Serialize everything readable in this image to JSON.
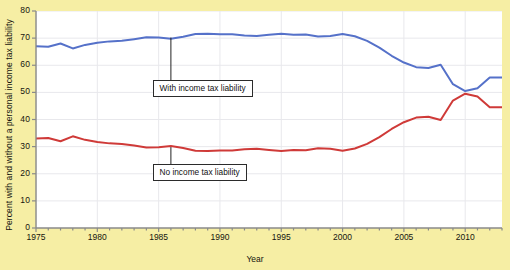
{
  "chart_data": {
    "type": "line",
    "title": "",
    "xlabel": "Year",
    "ylabel": "Percent with and without a personal income tax liability",
    "xlim": [
      1975,
      2013
    ],
    "ylim": [
      0,
      80
    ],
    "yticks": [
      0,
      10,
      20,
      30,
      40,
      50,
      60,
      70,
      80
    ],
    "xticks": [
      1975,
      1980,
      1985,
      1990,
      1995,
      2000,
      2005,
      2010
    ],
    "grid": true,
    "legend_position": "inline-callouts",
    "x": [
      1975,
      1976,
      1977,
      1978,
      1979,
      1980,
      1981,
      1982,
      1983,
      1984,
      1985,
      1986,
      1987,
      1988,
      1989,
      1990,
      1991,
      1992,
      1993,
      1994,
      1995,
      1996,
      1997,
      1998,
      1999,
      2000,
      2001,
      2002,
      2003,
      2004,
      2005,
      2006,
      2007,
      2008,
      2009,
      2010,
      2011,
      2012,
      2013
    ],
    "series": [
      {
        "name": "With income tax liability",
        "color": "#5571c9",
        "values": [
          67.0,
          66.8,
          68.0,
          66.2,
          67.5,
          68.3,
          68.8,
          69.0,
          69.6,
          70.3,
          70.2,
          69.8,
          70.5,
          71.5,
          71.6,
          71.4,
          71.4,
          71.0,
          70.8,
          71.2,
          71.6,
          71.2,
          71.3,
          70.6,
          70.8,
          71.5,
          70.7,
          69.0,
          66.5,
          63.5,
          61.0,
          59.3,
          59.0,
          60.2,
          53.0,
          50.5,
          51.5,
          55.5,
          55.5
        ]
      },
      {
        "name": "No income tax liability",
        "color": "#cf3a38",
        "values": [
          33.0,
          33.2,
          32.0,
          33.8,
          32.5,
          31.7,
          31.2,
          31.0,
          30.4,
          29.7,
          29.8,
          30.2,
          29.5,
          28.5,
          28.4,
          28.6,
          28.6,
          29.0,
          29.2,
          28.8,
          28.4,
          28.8,
          28.7,
          29.4,
          29.2,
          28.5,
          29.3,
          31.0,
          33.5,
          36.5,
          39.0,
          40.7,
          41.0,
          39.8,
          47.0,
          49.5,
          48.5,
          44.5,
          44.5
        ]
      }
    ],
    "annotations": [
      {
        "label": "With income tax liability",
        "points_to_year": 1986,
        "points_to_value": 70.2
      },
      {
        "label": "No income tax liability",
        "points_to_year": 1986,
        "points_to_value": 29.8
      }
    ]
  },
  "figure": {
    "background_color": "#f6eea4",
    "panel_color": "#ffffff",
    "grid_color": "#e8e8ec",
    "axis_color": "#8a8a8a"
  },
  "axes": {
    "y_tick_labels": [
      "0",
      "10",
      "20",
      "30",
      "40",
      "50",
      "60",
      "70",
      "80"
    ],
    "x_tick_labels": [
      "1975",
      "1980",
      "1985",
      "1990",
      "1995",
      "2000",
      "2005",
      "2010"
    ],
    "x_axis_title": "Year",
    "y_axis_title": "Percent with and without a personal income tax liability"
  }
}
